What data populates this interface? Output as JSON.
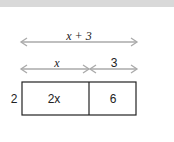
{
  "diagram": {
    "top_arrow_label": "x + 3",
    "segment_labels": [
      "x",
      "3"
    ],
    "side_label": "2",
    "cells": [
      "2x",
      "6"
    ],
    "colors": {
      "arrow": "#aaaaaa",
      "box": "#222222",
      "header": "#d9d9d9"
    }
  }
}
